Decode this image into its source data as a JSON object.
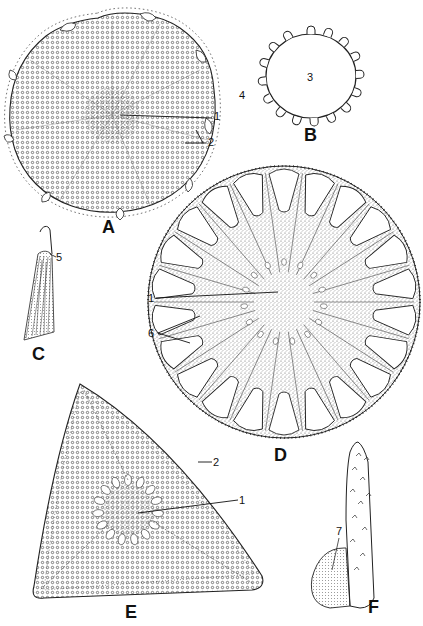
{
  "page": {
    "type": "scientific plate (line drawings)",
    "header_visible": "clipped running head (text cut off at top edge)"
  },
  "figures": [
    {
      "id": "A",
      "letter": "A",
      "subject": "circular valve with radial areolae and marginal processes",
      "labels": [
        {
          "text": "1",
          "target": "central area"
        },
        {
          "text": "2",
          "target": "marginal process"
        }
      ]
    },
    {
      "id": "B",
      "letter": "B",
      "subject": "oval outline with knobbed marginal processes",
      "labels": [
        {
          "text": "3",
          "target": "center"
        },
        {
          "text": "4",
          "target": "marginal process"
        }
      ]
    },
    {
      "id": "C",
      "letter": "C",
      "subject": "spine / process detail",
      "labels": [
        {
          "text": "5",
          "target": "tip"
        }
      ]
    },
    {
      "id": "D",
      "letter": "D",
      "subject": "radially chambered circular valve",
      "labels": [
        {
          "text": "1",
          "target": "central area"
        },
        {
          "text": "6",
          "target": "radial ribs"
        }
      ]
    },
    {
      "id": "E",
      "letter": "E",
      "subject": "triangular valve with central ring of openings",
      "labels": [
        {
          "text": "2",
          "target": "margin"
        },
        {
          "text": "1",
          "target": "central area"
        }
      ]
    },
    {
      "id": "F",
      "letter": "F",
      "subject": "elongated spinulose process with attached cell",
      "labels": [
        {
          "text": "7",
          "target": "attached cell"
        }
      ]
    }
  ],
  "colors": {
    "ink": "#1a1a1a",
    "paper": "#ffffff",
    "stipple": "#555555"
  }
}
